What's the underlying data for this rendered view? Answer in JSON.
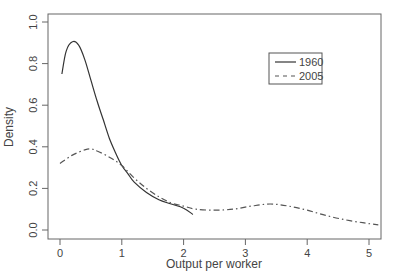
{
  "chart_data": {
    "type": "line",
    "title": "",
    "xlabel": "Output per worker",
    "ylabel": "Density",
    "xlim": [
      -0.1,
      5.2
    ],
    "ylim": [
      -0.03,
      1.05
    ],
    "xticks": [
      0,
      1,
      2,
      3,
      4,
      5
    ],
    "xtick_labels": [
      "0",
      "1",
      "2",
      "3",
      "4",
      "5"
    ],
    "yticks": [
      0.0,
      0.2,
      0.4,
      0.6,
      0.8,
      1.0
    ],
    "ytick_labels": [
      "0.0",
      "0.2",
      "0.4",
      "0.6",
      "0.8",
      "1.0"
    ],
    "grid": false,
    "legend_position": "upper right",
    "series": [
      {
        "name": "1960",
        "line_style": "solid",
        "color": "#333333",
        "x": [
          0.03,
          0.1,
          0.2,
          0.3,
          0.4,
          0.5,
          0.6,
          0.7,
          0.8,
          0.9,
          1.0,
          1.1,
          1.2,
          1.4,
          1.6,
          1.8,
          2.0,
          2.15
        ],
        "y": [
          0.75,
          0.86,
          0.905,
          0.89,
          0.82,
          0.72,
          0.62,
          0.53,
          0.44,
          0.37,
          0.31,
          0.27,
          0.23,
          0.18,
          0.145,
          0.125,
          0.105,
          0.075
        ]
      },
      {
        "name": "2005",
        "line_style": "dashdot",
        "color": "#555555",
        "x": [
          0.0,
          0.2,
          0.4,
          0.5,
          0.6,
          0.8,
          1.0,
          1.2,
          1.4,
          1.6,
          1.8,
          2.0,
          2.2,
          2.5,
          2.8,
          3.1,
          3.4,
          3.7,
          4.0,
          4.3,
          4.6,
          4.9,
          5.15
        ],
        "y": [
          0.32,
          0.36,
          0.385,
          0.39,
          0.38,
          0.35,
          0.31,
          0.25,
          0.2,
          0.16,
          0.13,
          0.115,
          0.1,
          0.095,
          0.1,
          0.115,
          0.125,
          0.115,
          0.095,
          0.07,
          0.05,
          0.035,
          0.025
        ]
      }
    ]
  }
}
